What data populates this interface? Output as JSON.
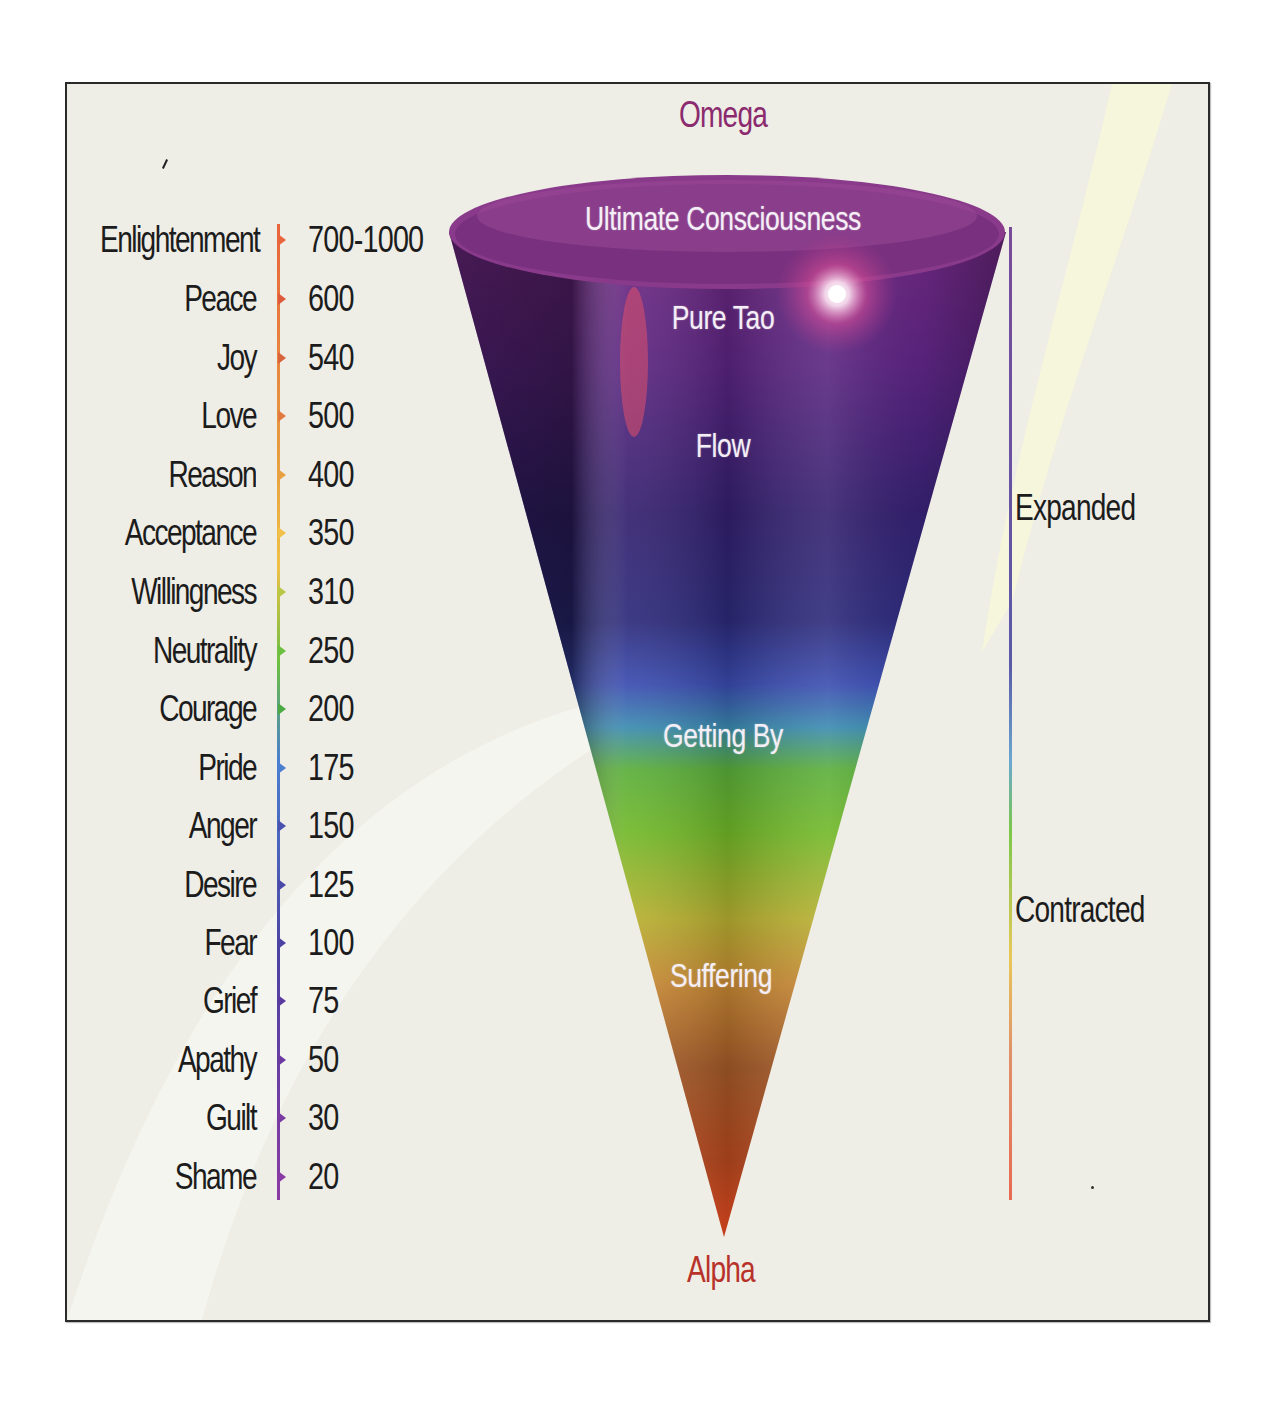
{
  "diagram": {
    "title_top": "Omega",
    "title_bottom": "Alpha",
    "colors": {
      "omega": "#8b2a6e",
      "alpha": "#b8322a",
      "background": "#eeede6",
      "frame_border": "#2a2a2a",
      "text": "#1c1c1c"
    },
    "cone_labels": [
      {
        "text": "Ultimate Consciousness",
        "y": 198
      },
      {
        "text": "Pure Tao",
        "y": 297
      },
      {
        "text": "Flow",
        "y": 425
      },
      {
        "text": "Getting By",
        "y": 715
      },
      {
        "text": "Suffering",
        "y": 955
      }
    ],
    "right_axis": {
      "labels": [
        {
          "text": "Expanded",
          "y": 488
        },
        {
          "text": "Contracted",
          "y": 890
        }
      ]
    },
    "scale": [
      {
        "level": "Enlightenment",
        "value": "700-1000",
        "y": 240,
        "color": "#e8643a"
      },
      {
        "level": "Peace",
        "value": "600",
        "y": 299,
        "color": "#de5a3a"
      },
      {
        "level": "Joy",
        "value": "540",
        "y": 358,
        "color": "#d9643c"
      },
      {
        "level": "Love",
        "value": "500",
        "y": 416,
        "color": "#e07a3e"
      },
      {
        "level": "Reason",
        "value": "400",
        "y": 475,
        "color": "#e8a040"
      },
      {
        "level": "Acceptance",
        "value": "350",
        "y": 533,
        "color": "#f0c048"
      },
      {
        "level": "Willingness",
        "value": "310",
        "y": 592,
        "color": "#b8c844"
      },
      {
        "level": "Neutrality",
        "value": "250",
        "y": 651,
        "color": "#6cc040"
      },
      {
        "level": "Courage",
        "value": "200",
        "y": 709,
        "color": "#4caa44"
      },
      {
        "level": "Pride",
        "value": "175",
        "y": 768,
        "color": "#4a7ed0"
      },
      {
        "level": "Anger",
        "value": "150",
        "y": 826,
        "color": "#4a52b0"
      },
      {
        "level": "Desire",
        "value": "125",
        "y": 885,
        "color": "#4a48a8"
      },
      {
        "level": "Fear",
        "value": "100",
        "y": 943,
        "color": "#4c42a4"
      },
      {
        "level": "Grief",
        "value": "75",
        "y": 1001,
        "color": "#5a3aa0"
      },
      {
        "level": "Apathy",
        "value": "50",
        "y": 1060,
        "color": "#6a3aa0"
      },
      {
        "level": "Guilt",
        "value": "30",
        "y": 1118,
        "color": "#7a3aa2"
      },
      {
        "level": "Shame",
        "value": "20",
        "y": 1177,
        "color": "#8a3aa4"
      }
    ]
  }
}
